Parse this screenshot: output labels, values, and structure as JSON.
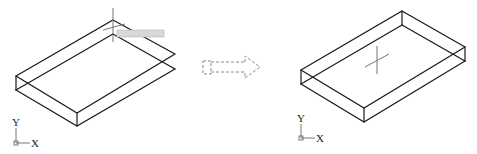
{
  "diagram": {
    "before": {
      "tooltip": "",
      "ucs": {
        "x_label": "X",
        "y_label": "Y"
      }
    },
    "arrow": {
      "style": "dashed",
      "direction": "right"
    },
    "after": {
      "ucs": {
        "x_label": "X",
        "y_label": "Y"
      }
    }
  },
  "colors": {
    "line": "#1a1a1a",
    "cursor": "#777777",
    "background": "#ffffff"
  }
}
